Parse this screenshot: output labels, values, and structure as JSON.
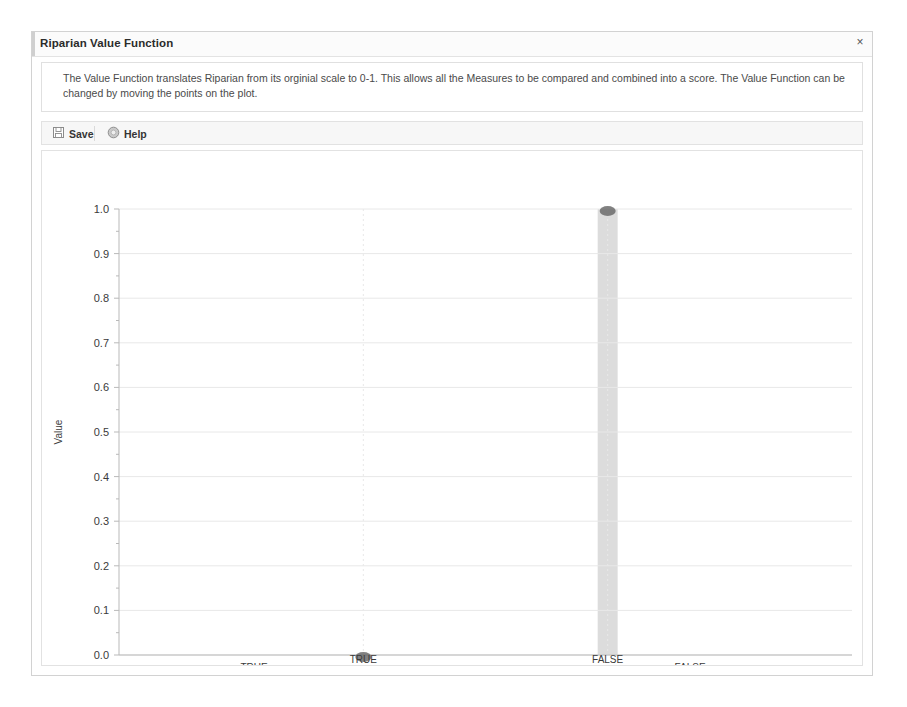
{
  "window": {
    "title": "Riparian Value Function",
    "close_label": "×",
    "description": "The Value Function translates Riparian from its orginial scale to 0-1. This allows all the Measures to be compared and combined into a score. The Value Function can be changed by moving the points on the plot."
  },
  "toolbar": {
    "save_label": "Save",
    "save_icon": "save-floppy-icon",
    "help_label": "Help",
    "help_icon": "help-circle-icon"
  },
  "colors": {
    "window_border": "#d2d2d2",
    "title_text": "#2b2b2b",
    "panel_border": "#e2e2e2",
    "toolbar_bg": "#f7f7f7",
    "grid": "#e8e8e8",
    "axis": "#b9b9b9",
    "marker": "#6b6b6b",
    "selection_band": "#d6d6d6"
  },
  "chart_data": {
    "type": "scatter",
    "title": "",
    "xlabel": "Riparian",
    "ylabel": "Value",
    "categories": [
      "TRUE",
      "FALSE"
    ],
    "values": [
      0.0,
      1.0
    ],
    "ylim": [
      0.0,
      1.0
    ],
    "ytick_labels": [
      "0.0",
      "0.1",
      "0.2",
      "0.3",
      "0.4",
      "0.5",
      "0.6",
      "0.7",
      "0.8",
      "0.9",
      "1.0"
    ],
    "ytick_values": [
      0.0,
      0.1,
      0.2,
      0.3,
      0.4,
      0.5,
      0.6,
      0.7,
      0.8,
      0.9,
      1.0
    ],
    "grid": true,
    "legend": "none",
    "annotations": [
      {
        "category": "FALSE",
        "type": "selection-band",
        "from": 0.0,
        "to": 1.0
      }
    ]
  }
}
